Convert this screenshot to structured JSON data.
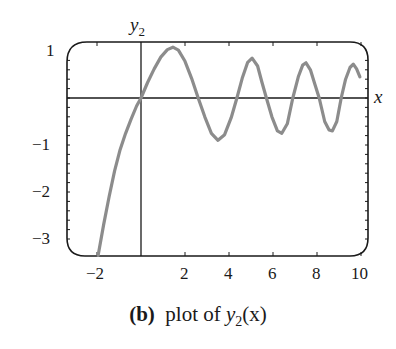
{
  "chart_data": {
    "type": "line",
    "title": "",
    "xlabel": "x",
    "ylabel": "y_2",
    "xlim": [
      -3.3,
      10.3
    ],
    "ylim": [
      -3.35,
      1.2
    ],
    "x_ticks": [
      -2,
      2,
      4,
      6,
      8,
      10
    ],
    "y_ticks": [
      1,
      -1,
      -2,
      -3
    ],
    "grid": false,
    "legend": null,
    "series": [
      {
        "name": "y2(x)",
        "color": "#8c8c8c",
        "x": [
          -1.95,
          -1.7,
          -1.45,
          -1.2,
          -0.95,
          -0.7,
          -0.45,
          -0.2,
          0,
          0.3,
          0.6,
          0.9,
          1.2,
          1.45,
          1.7,
          2.0,
          2.3,
          2.6,
          2.9,
          3.2,
          3.5,
          3.8,
          4.1,
          4.36,
          4.6,
          4.85,
          5.05,
          5.3,
          5.5,
          5.7,
          5.95,
          6.2,
          6.4,
          6.65,
          6.9,
          7.15,
          7.35,
          7.5,
          7.7,
          7.9,
          8.1,
          8.35,
          8.55,
          8.7,
          8.9,
          9.1,
          9.3,
          9.5,
          9.65,
          9.8,
          9.95
        ],
        "y": [
          -3.35,
          -2.7,
          -2.1,
          -1.55,
          -1.1,
          -0.75,
          -0.45,
          -0.17,
          0,
          0.33,
          0.62,
          0.87,
          1.03,
          1.08,
          1.02,
          0.78,
          0.42,
          0.0,
          -0.4,
          -0.75,
          -0.9,
          -0.78,
          -0.42,
          0.0,
          0.42,
          0.76,
          0.85,
          0.68,
          0.33,
          0.0,
          -0.4,
          -0.7,
          -0.75,
          -0.55,
          0.0,
          0.45,
          0.7,
          0.75,
          0.6,
          0.3,
          0.0,
          -0.5,
          -0.68,
          -0.7,
          -0.5,
          0.0,
          0.4,
          0.65,
          0.72,
          0.62,
          0.45
        ]
      }
    ],
    "annotations": [
      "(b) plot of y2(x)"
    ]
  },
  "labels": {
    "y_axis_name": "y",
    "y_axis_sub": "2",
    "x_axis_name": "x",
    "x_tick_labels": [
      "−2",
      "2",
      "4",
      "6",
      "8",
      "10"
    ],
    "y_tick_labels": [
      "1",
      "−1",
      "−2",
      "−3"
    ]
  },
  "caption": {
    "tag": "(b)",
    "text_prefix": "plot of ",
    "func": "y",
    "func_sub": "2",
    "func_arg": "(x)"
  }
}
